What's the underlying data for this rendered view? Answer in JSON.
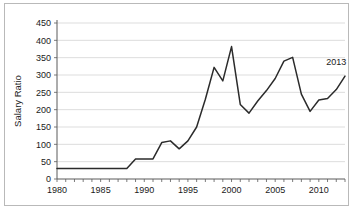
{
  "chart_data": {
    "type": "line",
    "title": "",
    "xlabel": "",
    "ylabel": "Salary Ratio",
    "xlim": [
      1980,
      2013
    ],
    "ylim": [
      0,
      450
    ],
    "ytick_step": 50,
    "xtick_step": 1,
    "xtick_label_step": 5,
    "grid": true,
    "legend": null,
    "x": [
      1980,
      1981,
      1982,
      1983,
      1984,
      1985,
      1986,
      1987,
      1988,
      1989,
      1990,
      1991,
      1992,
      1993,
      1994,
      1995,
      1996,
      1997,
      1998,
      1999,
      2000,
      2001,
      2002,
      2003,
      2004,
      2005,
      2006,
      2007,
      2008,
      2009,
      2010,
      2011,
      2012,
      2013
    ],
    "values": [
      30,
      30,
      30,
      30,
      30,
      30,
      30,
      30,
      30,
      58,
      58,
      58,
      105,
      110,
      87,
      110,
      150,
      230,
      322,
      283,
      382,
      215,
      190,
      225,
      255,
      290,
      340,
      351,
      245,
      195,
      228,
      232,
      258,
      297
    ],
    "series": [
      {
        "name": "Salary Ratio",
        "color": "#2b2b2b",
        "values": [
          30,
          30,
          30,
          30,
          30,
          30,
          30,
          30,
          30,
          58,
          58,
          58,
          105,
          110,
          87,
          110,
          150,
          230,
          322,
          283,
          382,
          215,
          190,
          225,
          255,
          290,
          340,
          351,
          245,
          195,
          228,
          232,
          258,
          297
        ]
      }
    ],
    "ytick_labels": [
      "0",
      "50",
      "100",
      "150",
      "200",
      "250",
      "300",
      "350",
      "400",
      "450"
    ],
    "xtick_labels": [
      "1980",
      "1985",
      "1990",
      "1995",
      "2000",
      "2005",
      "2010"
    ],
    "annotations": [
      {
        "text": "2013",
        "x": 2012,
        "y": 330
      }
    ]
  },
  "axes": {
    "y_title": "Salary Ratio",
    "y_ticks": [
      {
        "value": 450,
        "label": "450"
      },
      {
        "value": 400,
        "label": "400"
      },
      {
        "value": 350,
        "label": "350"
      },
      {
        "value": 300,
        "label": "300"
      },
      {
        "value": 250,
        "label": "250"
      },
      {
        "value": 200,
        "label": "200"
      },
      {
        "value": 150,
        "label": "150"
      },
      {
        "value": 100,
        "label": "100"
      },
      {
        "value": 50,
        "label": "50"
      },
      {
        "value": 0,
        "label": "0"
      }
    ],
    "x_ticks": [
      {
        "value": 1980,
        "label": "1980"
      },
      {
        "value": 1985,
        "label": "1985"
      },
      {
        "value": 1990,
        "label": "1990"
      },
      {
        "value": 1995,
        "label": "1995"
      },
      {
        "value": 2000,
        "label": "2000"
      },
      {
        "value": 2005,
        "label": "2005"
      },
      {
        "value": 2010,
        "label": "2010"
      }
    ]
  },
  "colors": {
    "line": "#2b2b2b",
    "grid": "#cfcfcf",
    "axis": "#5a5a5a",
    "frame": "#b9b9b9",
    "background": "#ffffff",
    "text": "#1a1a1a"
  }
}
